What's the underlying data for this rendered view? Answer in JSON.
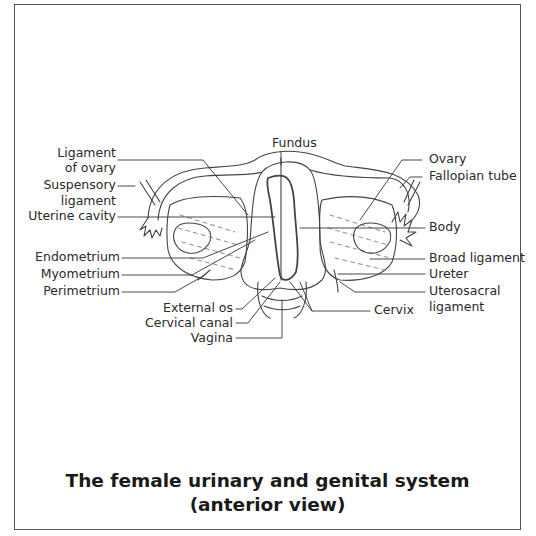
{
  "diagram": {
    "title_line1": "The female urinary and genital system",
    "title_line2": "(anterior view)",
    "labels": {
      "fundus": "Fundus",
      "ligament_of_ovary_1": "Ligament",
      "ligament_of_ovary_2": "of ovary",
      "suspensory_ligament_1": "Suspensory",
      "suspensory_ligament_2": "ligament",
      "uterine_cavity": "Uterine cavity",
      "endometrium": "Endometrium",
      "myometrium": "Myometrium",
      "perimetrium": "Perimetrium",
      "external_os": "External os",
      "cervical_canal": "Cervical canal",
      "vagina": "Vagina",
      "ovary": "Ovary",
      "fallopian_tube": "Fallopian tube",
      "body": "Body",
      "broad_ligament": "Broad ligament",
      "ureter": "Ureter",
      "uterosacral_ligament_1": "Uterosacral",
      "uterosacral_ligament_2": "ligament",
      "cervix": "Cervix"
    }
  }
}
